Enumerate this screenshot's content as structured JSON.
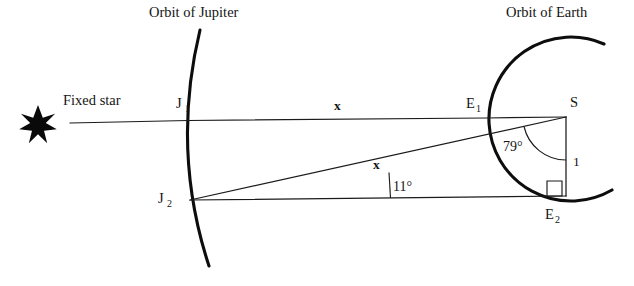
{
  "figure": {
    "type": "geometry-diagram",
    "background_color": "#ffffff",
    "ink_color": "#141414"
  },
  "titles": {
    "jupiter_orbit": "Orbit of Jupiter",
    "earth_orbit": "Orbit of Earth"
  },
  "labels": {
    "fixed_star": "Fixed star",
    "star_icon": "seven-pointed-star",
    "j1": "J",
    "j1_sub": "1",
    "j2": "J",
    "j2_sub": "2",
    "e1": "E",
    "e1_sub": "1",
    "e2": "E",
    "e2_sub": "2",
    "sun": "S"
  },
  "measures": {
    "x_top": "x",
    "x_diagonal": "x",
    "angle_at_sun": "79°",
    "angle_at_j2": "11°",
    "side_one": "1",
    "right_angle_marker": "right-angle-square"
  },
  "geometry": {
    "points": {
      "star": [
        38,
        124
      ],
      "line_start": [
        70,
        123
      ],
      "j1": [
        188,
        120
      ],
      "j2": [
        190,
        200
      ],
      "e1": [
        486,
        118
      ],
      "sun": [
        566,
        117
      ],
      "e2": [
        566,
        196
      ]
    },
    "jupiter_arc": "M 200 30 Q 172 150 208 266",
    "earth_arc": "M 604 44 A 82 82 0 1 0 612 190",
    "angle_arc_sun": "M 529 128 A 42 42 0 0 0 566 159",
    "angle_tick_j2": "M 387 172 L 390 199"
  }
}
